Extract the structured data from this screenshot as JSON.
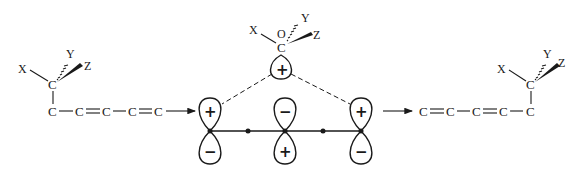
{
  "figure": {
    "left_molecule": {
      "substituents": [
        "X",
        "Y",
        "Z"
      ],
      "migrating_carbon": "C",
      "chain": [
        "C",
        "C",
        "C",
        "C",
        "C"
      ],
      "bonds": [
        "single",
        "double",
        "single",
        "double"
      ]
    },
    "transition_state": {
      "top_group": {
        "substituents": [
          "X",
          "Y",
          "Z"
        ],
        "carbon": "C",
        "orbital_label": "O",
        "lobe_sign": "+"
      },
      "orbitals": [
        {
          "top": "+",
          "bottom": "−"
        },
        {
          "top": "−",
          "bottom": "+"
        },
        {
          "top": "+",
          "bottom": "−"
        }
      ]
    },
    "right_molecule": {
      "substituents": [
        "X",
        "Y",
        "Z"
      ],
      "migrating_carbon": "C",
      "chain": [
        "C",
        "C",
        "C",
        "C",
        "C"
      ],
      "bonds": [
        "double",
        "single",
        "double",
        "single"
      ]
    },
    "colors": {
      "ink": "#1a1a1a",
      "background": "#ffffff"
    }
  }
}
